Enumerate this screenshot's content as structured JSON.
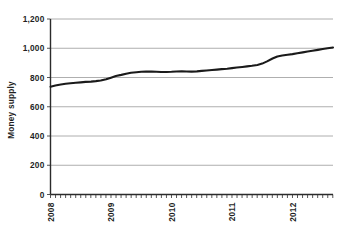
{
  "chart_data": {
    "type": "line",
    "title": "",
    "xlabel": "",
    "ylabel": "Money supply",
    "ylim": [
      0,
      1200
    ],
    "xlim": [
      2008.0,
      2012.67
    ],
    "grid": true,
    "legend": "none",
    "ytick_labels": [
      "0",
      "200",
      "400",
      "600",
      "800",
      "1,000",
      "1,200"
    ],
    "ytick_values": [
      0,
      200,
      400,
      600,
      800,
      1000,
      1200
    ],
    "xtick_labels": [
      "2008",
      "2009",
      "2010",
      "2011",
      "2012"
    ],
    "xtick_values": [
      2008,
      2009,
      2010,
      2011,
      2012
    ],
    "minor_xticks_per_year": 12,
    "series": [
      {
        "name": "Money supply",
        "color": "#1a1a1a",
        "x": [
          2008.0,
          2008.08,
          2008.17,
          2008.25,
          2008.33,
          2008.42,
          2008.5,
          2008.58,
          2008.67,
          2008.75,
          2008.83,
          2008.92,
          2009.0,
          2009.08,
          2009.17,
          2009.25,
          2009.33,
          2009.42,
          2009.5,
          2009.58,
          2009.67,
          2009.75,
          2009.83,
          2009.92,
          2010.0,
          2010.08,
          2010.17,
          2010.25,
          2010.33,
          2010.42,
          2010.5,
          2010.58,
          2010.67,
          2010.75,
          2010.83,
          2010.92,
          2011.0,
          2011.08,
          2011.17,
          2011.25,
          2011.33,
          2011.42,
          2011.5,
          2011.58,
          2011.67,
          2011.75,
          2011.83,
          2011.92,
          2012.0,
          2012.08,
          2012.17,
          2012.25,
          2012.33,
          2012.42,
          2012.5,
          2012.58,
          2012.67
        ],
        "values": [
          737,
          745,
          752,
          757,
          761,
          764,
          767,
          770,
          772,
          775,
          779,
          788,
          799,
          810,
          818,
          826,
          832,
          836,
          839,
          840,
          840,
          839,
          838,
          838,
          839,
          841,
          842,
          841,
          840,
          842,
          845,
          848,
          851,
          854,
          857,
          860,
          864,
          868,
          872,
          876,
          880,
          886,
          895,
          910,
          930,
          944,
          950,
          955,
          960,
          966,
          972,
          978,
          983,
          989,
          995,
          1000,
          1005
        ]
      }
    ]
  },
  "axes": {
    "ylabel": "Money supply"
  }
}
